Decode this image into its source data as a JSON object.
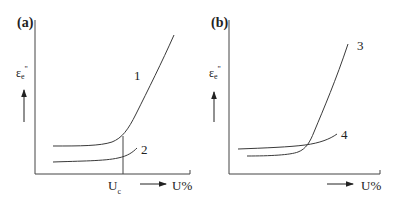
{
  "panels": [
    {
      "tag": "(a)",
      "y_label": {
        "symbol": "ε",
        "sub": "e",
        "sup": "\""
      },
      "x_label": "U%",
      "x_marker": {
        "label_main": "U",
        "label_sub": "c"
      },
      "curves": [
        {
          "id": "1",
          "label": "1",
          "description": "flat then sharp rise after Uc"
        },
        {
          "id": "2",
          "label": "2",
          "description": "flat, slight rise"
        }
      ]
    },
    {
      "tag": "(b)",
      "y_label": {
        "symbol": "ε",
        "sub": "e",
        "sup": "\""
      },
      "x_label": "U%",
      "curves": [
        {
          "id": "3",
          "label": "3",
          "description": "flat then steep rise, crosses curve 4"
        },
        {
          "id": "4",
          "label": "4",
          "description": "nearly flat, slight rise"
        }
      ]
    }
  ],
  "colors": {
    "line": "#3a3a3a",
    "axis": "#444444",
    "background": "#ffffff"
  }
}
